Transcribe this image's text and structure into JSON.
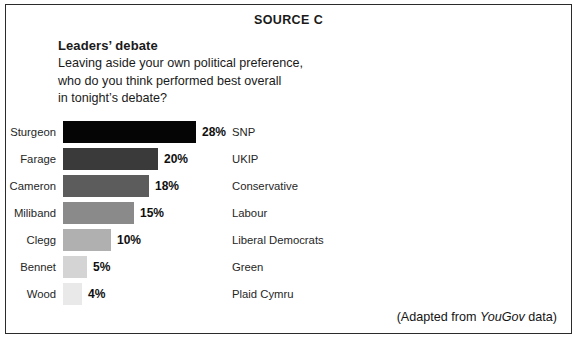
{
  "source_label": "SOURCE C",
  "block_title": "Leaders’ debate",
  "question_lines": [
    "Leaving aside your own political preference,",
    "who do you think performed best overall",
    "in tonight’s debate?"
  ],
  "attribution": {
    "prefix": "(Adapted from ",
    "brand": "YouGov",
    "suffix": " data)"
  },
  "chart_data": {
    "type": "bar",
    "orientation": "horizontal",
    "title": "Leaders’ debate",
    "subtitle": "Leaving aside your own political preference, who do you think performed best overall in tonight’s debate?",
    "xlabel": "",
    "ylabel": "",
    "xlim": [
      0,
      28
    ],
    "grid": false,
    "legend": "none",
    "value_suffix": "%",
    "categories": [
      "Sturgeon",
      "Farage",
      "Cameron",
      "Miliband",
      "Clegg",
      "Bennet",
      "Wood"
    ],
    "values": [
      28,
      20,
      18,
      15,
      10,
      5,
      4
    ],
    "value_labels": [
      "28%",
      "20%",
      "18%",
      "15%",
      "10%",
      "5%",
      "4%"
    ],
    "secondary_categories": [
      "SNP",
      "UKIP",
      "Conservative",
      "Labour",
      "Liberal Democrats",
      "Green",
      "Plaid Cymru"
    ],
    "bar_colors": [
      "#050505",
      "#3a3a3a",
      "#5c5c5c",
      "#8a8a8a",
      "#b0b0b0",
      "#d4d4d4",
      "#e9e9e9"
    ],
    "bars": [
      {
        "name": "Sturgeon",
        "value": 28,
        "label": "28%",
        "party": "SNP",
        "color": "#050505",
        "width_px": 133
      },
      {
        "name": "Farage",
        "value": 20,
        "label": "20%",
        "party": "UKIP",
        "color": "#3a3a3a",
        "width_px": 95
      },
      {
        "name": "Cameron",
        "value": 18,
        "label": "18%",
        "party": "Conservative",
        "color": "#5c5c5c",
        "width_px": 86
      },
      {
        "name": "Miliband",
        "value": 15,
        "label": "15%",
        "party": "Labour",
        "color": "#8a8a8a",
        "width_px": 71
      },
      {
        "name": "Clegg",
        "value": 10,
        "label": "10%",
        "party": "Liberal Democrats",
        "color": "#b0b0b0",
        "width_px": 48
      },
      {
        "name": "Bennet",
        "value": 5,
        "label": "5%",
        "party": "Green",
        "color": "#d4d4d4",
        "width_px": 24
      },
      {
        "name": "Wood",
        "value": 4,
        "label": "4%",
        "party": "Plaid Cymru",
        "color": "#e9e9e9",
        "width_px": 19
      }
    ]
  }
}
